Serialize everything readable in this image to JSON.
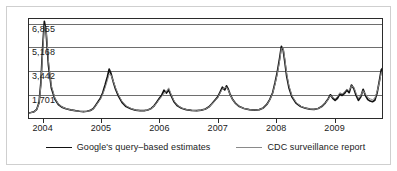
{
  "figure": {
    "background_color": "#ffffff",
    "border_color": "#cfcfcf",
    "axis_color": "#2b2b2b",
    "grid_color": "#6e6e6e"
  },
  "legend": {
    "position": "bottom-center",
    "entries": [
      {
        "label": "Google's query–based estimates",
        "color": "#121212",
        "style": "solid-thick",
        "icon": "line-swatch-icon"
      },
      {
        "label": "CDC surveillance report",
        "color": "#8a8a8a",
        "style": "solid-thin",
        "icon": "line-swatch-icon"
      }
    ]
  },
  "chart_data": {
    "type": "line",
    "title": "",
    "subtitle": "",
    "xlabel": "",
    "ylabel": "",
    "grid": true,
    "legend_position": "bottom-center",
    "xlim": [
      2003.75,
      2009.83
    ],
    "ylim": [
      0,
      7300
    ],
    "xticks": [
      2004,
      2005,
      2006,
      2007,
      2008,
      2009
    ],
    "xtick_labels": [
      "2004",
      "2005",
      "2006",
      "2007",
      "2008",
      "2009"
    ],
    "yticks": [
      1701,
      3442,
      5168,
      6855
    ],
    "ytick_labels": [
      "1,701",
      "3,442",
      "5,168",
      "6,855"
    ],
    "series": [
      {
        "name": "Google's query–based estimates",
        "color": "#121212",
        "width": 1.7,
        "x": [
          2003.75,
          2003.8,
          2003.85,
          2003.9,
          2003.94,
          2003.97,
          2004.0,
          2004.03,
          2004.06,
          2004.1,
          2004.15,
          2004.21,
          2004.27,
          2004.33,
          2004.4,
          2004.48,
          2004.56,
          2004.63,
          2004.7,
          2004.76,
          2004.82,
          2004.87,
          2004.91,
          2004.95,
          2004.99,
          2005.03,
          2005.07,
          2005.11,
          2005.14,
          2005.17,
          2005.21,
          2005.25,
          2005.3,
          2005.36,
          2005.43,
          2005.51,
          2005.59,
          2005.67,
          2005.74,
          2005.8,
          2005.86,
          2005.91,
          2005.96,
          2006.0,
          2006.04,
          2006.08,
          2006.12,
          2006.16,
          2006.2,
          2006.25,
          2006.31,
          2006.38,
          2006.46,
          2006.55,
          2006.64,
          2006.72,
          2006.79,
          2006.85,
          2006.9,
          2006.95,
          2007.0,
          2007.04,
          2007.08,
          2007.12,
          2007.15,
          2007.18,
          2007.21,
          2007.25,
          2007.3,
          2007.37,
          2007.45,
          2007.54,
          2007.63,
          2007.71,
          2007.78,
          2007.84,
          2007.89,
          2007.94,
          2007.98,
          2008.02,
          2008.06,
          2008.09,
          2008.12,
          2008.15,
          2008.18,
          2008.22,
          2008.27,
          2008.34,
          2008.42,
          2008.5,
          2008.58,
          2008.65,
          2008.72,
          2008.78,
          2008.84,
          2008.89,
          2008.93,
          2008.97,
          2009.01,
          2009.05,
          2009.09,
          2009.13,
          2009.17,
          2009.21,
          2009.25,
          2009.29,
          2009.33,
          2009.37,
          2009.41,
          2009.45,
          2009.49,
          2009.53,
          2009.57,
          2009.61,
          2009.65,
          2009.69,
          2009.73,
          2009.77,
          2009.8,
          2009.83
        ],
        "values": [
          430,
          470,
          520,
          700,
          1200,
          2600,
          5100,
          7050,
          6300,
          3900,
          2250,
          1450,
          1050,
          860,
          740,
          660,
          600,
          560,
          540,
          560,
          620,
          760,
          1000,
          1250,
          1500,
          1900,
          2450,
          3050,
          3600,
          3300,
          2700,
          2150,
          1650,
          1200,
          900,
          740,
          640,
          600,
          600,
          650,
          760,
          950,
          1250,
          1500,
          1720,
          2080,
          1880,
          2100,
          1700,
          1250,
          950,
          780,
          680,
          620,
          600,
          640,
          720,
          880,
          1100,
          1350,
          1600,
          1950,
          2300,
          2100,
          2400,
          2150,
          1800,
          1450,
          1150,
          900,
          760,
          680,
          640,
          680,
          800,
          1050,
          1400,
          1900,
          2600,
          3400,
          4400,
          5250,
          5000,
          4100,
          3100,
          2250,
          1600,
          1150,
          900,
          780,
          720,
          700,
          760,
          900,
          1150,
          1450,
          1750,
          1500,
          1350,
          1500,
          1800,
          1700,
          1850,
          2100,
          1900,
          2450,
          2200,
          1700,
          1350,
          1600,
          2150,
          1700,
          1400,
          1300,
          1250,
          1350,
          1900,
          2800,
          3550,
          3700
        ]
      },
      {
        "name": "CDC surveillance report",
        "color": "#8a8a8a",
        "width": 1.0,
        "x": [
          2003.75,
          2003.8,
          2003.85,
          2003.9,
          2003.94,
          2003.97,
          2004.0,
          2004.03,
          2004.06,
          2004.1,
          2004.15,
          2004.21,
          2004.27,
          2004.33,
          2004.4,
          2004.48,
          2004.56,
          2004.63,
          2004.7,
          2004.76,
          2004.82,
          2004.87,
          2004.91,
          2004.95,
          2004.99,
          2005.03,
          2005.07,
          2005.11,
          2005.14,
          2005.17,
          2005.21,
          2005.25,
          2005.3,
          2005.36,
          2005.43,
          2005.51,
          2005.59,
          2005.67,
          2005.74,
          2005.8,
          2005.86,
          2005.91,
          2005.96,
          2006.0,
          2006.04,
          2006.08,
          2006.12,
          2006.16,
          2006.2,
          2006.25,
          2006.31,
          2006.38,
          2006.46,
          2006.55,
          2006.64,
          2006.72,
          2006.79,
          2006.85,
          2006.9,
          2006.95,
          2007.0,
          2007.04,
          2007.08,
          2007.12,
          2007.15,
          2007.18,
          2007.21,
          2007.25,
          2007.3,
          2007.37,
          2007.45,
          2007.54,
          2007.63,
          2007.71,
          2007.78,
          2007.84,
          2007.89,
          2007.94,
          2007.98,
          2008.02,
          2008.06,
          2008.09,
          2008.12,
          2008.15,
          2008.18,
          2008.22,
          2008.27,
          2008.34,
          2008.42,
          2008.5,
          2008.58,
          2008.65,
          2008.72,
          2008.78,
          2008.84,
          2008.89,
          2008.93,
          2008.97,
          2009.01,
          2009.05,
          2009.09,
          2009.13,
          2009.17,
          2009.21,
          2009.25,
          2009.29,
          2009.33,
          2009.37,
          2009.41,
          2009.45,
          2009.49,
          2009.53,
          2009.57,
          2009.61,
          2009.65,
          2009.69,
          2009.73,
          2009.77,
          2009.8,
          2009.83
        ],
        "values": [
          420,
          460,
          510,
          690,
          1150,
          2400,
          4700,
          6750,
          6500,
          4200,
          2400,
          1520,
          1080,
          880,
          750,
          660,
          600,
          560,
          540,
          560,
          610,
          740,
          960,
          1200,
          1420,
          1780,
          2250,
          2800,
          3250,
          3200,
          2750,
          2250,
          1750,
          1280,
          950,
          770,
          650,
          600,
          600,
          650,
          750,
          930,
          1200,
          1430,
          1630,
          1850,
          2000,
          2250,
          1800,
          1320,
          990,
          800,
          690,
          620,
          600,
          640,
          720,
          870,
          1080,
          1320,
          1560,
          1880,
          2180,
          2250,
          2300,
          2100,
          1780,
          1440,
          1150,
          900,
          760,
          680,
          640,
          680,
          790,
          1030,
          1370,
          1850,
          2500,
          3250,
          4200,
          5100,
          5150,
          4300,
          3300,
          2400,
          1700,
          1200,
          930,
          790,
          720,
          700,
          755,
          890,
          1130,
          1420,
          1700,
          1560,
          1450,
          1620,
          1900,
          1820,
          1950,
          2150,
          2050,
          2400,
          2300,
          1850,
          1500,
          1700,
          2050,
          1800,
          1550,
          1450,
          1400,
          1500,
          2000,
          2700,
          3350,
          3500
        ]
      }
    ]
  }
}
